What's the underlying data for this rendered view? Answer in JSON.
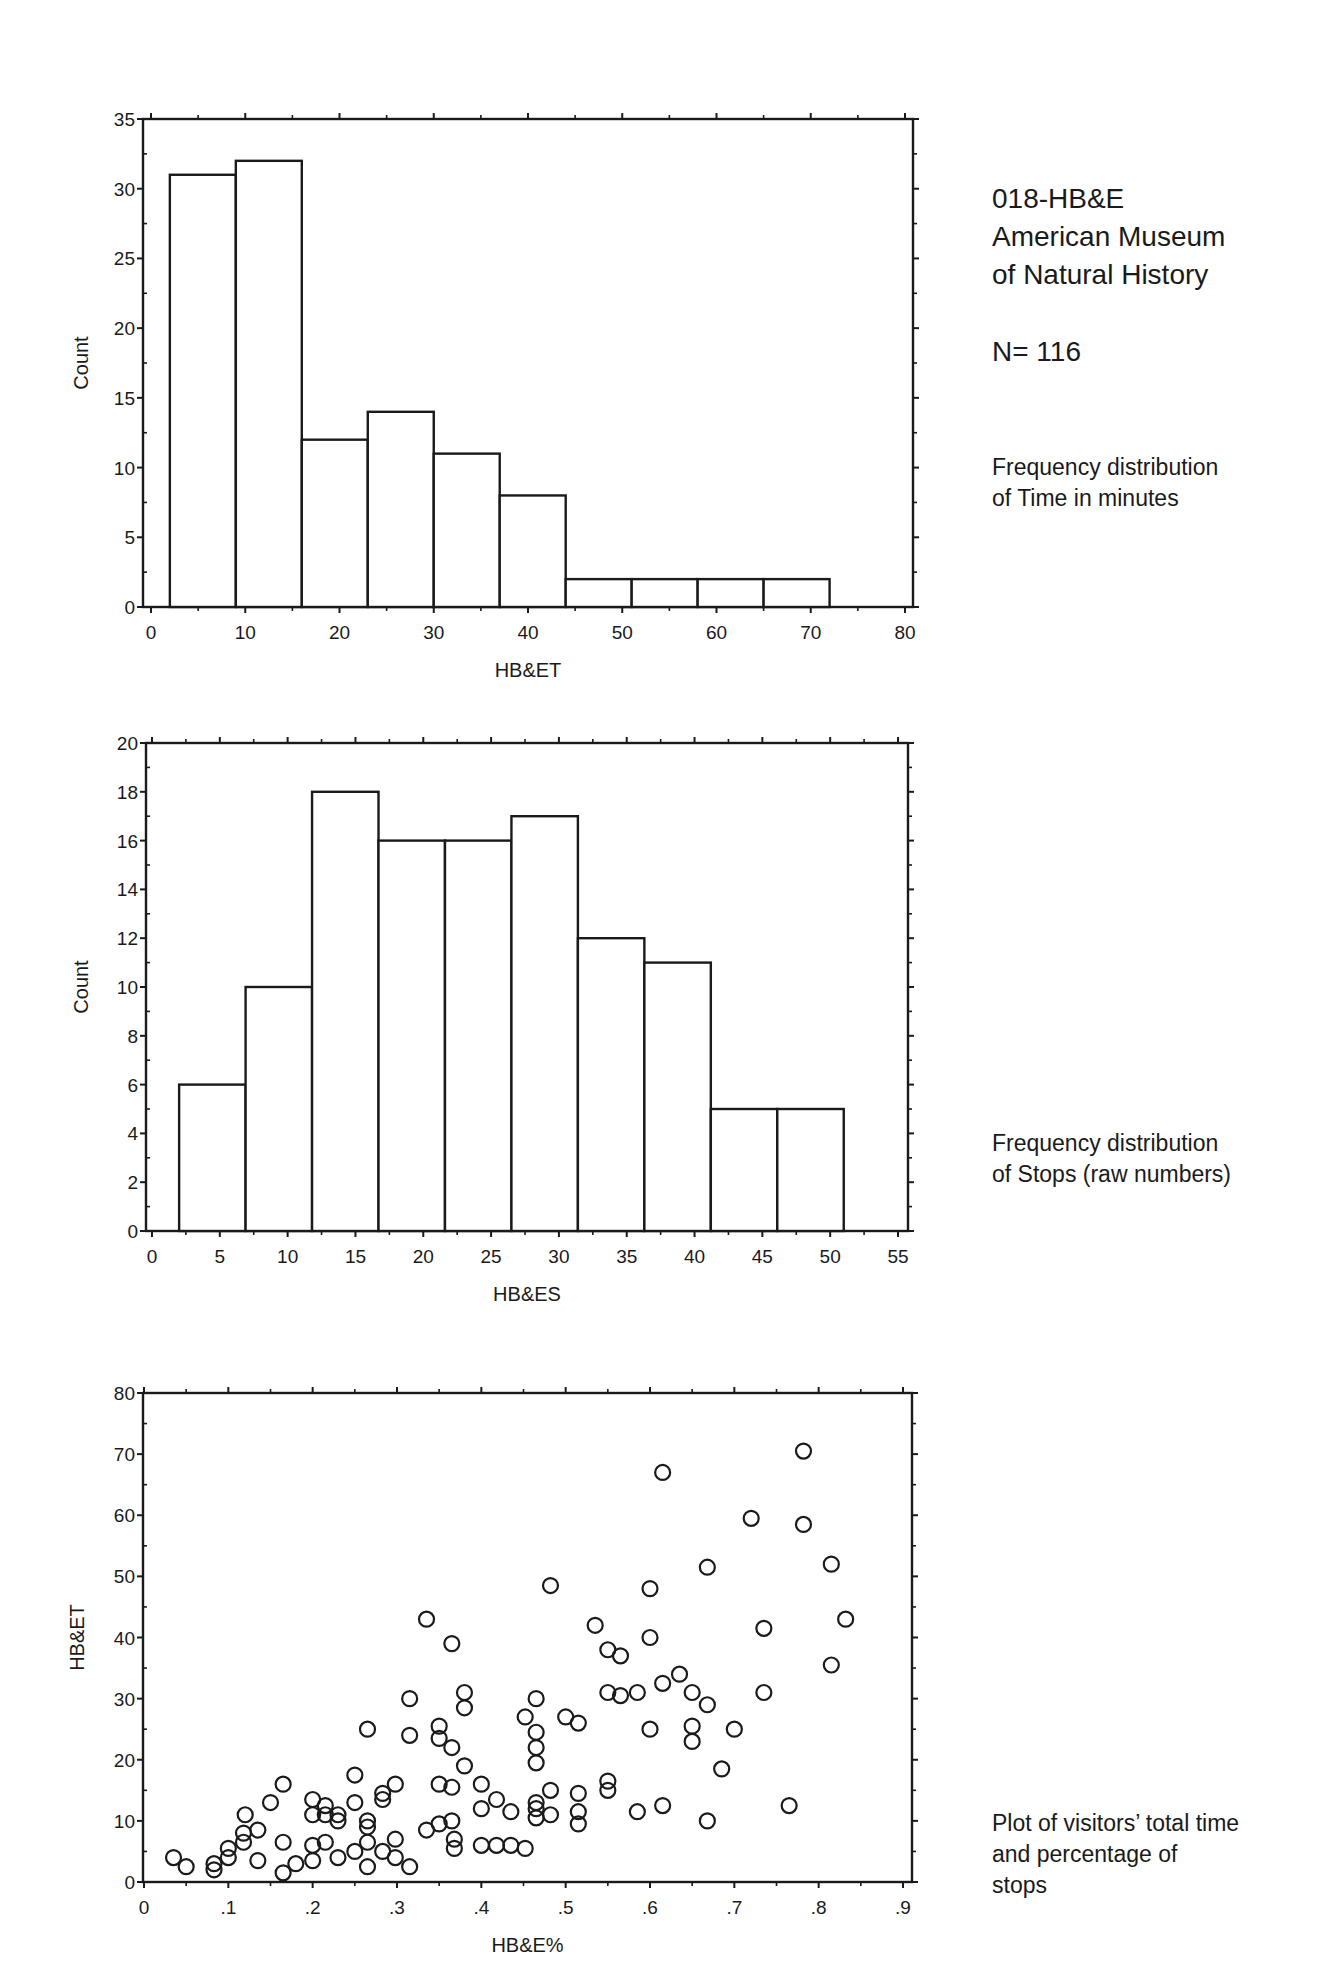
{
  "header": {
    "title_lines": [
      "018-HB&E",
      "American Museum",
      "of Natural History"
    ],
    "n_label": "N= 116"
  },
  "captions": {
    "time_hist": [
      "Frequency distribution",
      "of Time in minutes"
    ],
    "stops_hist": [
      "Frequency distribution",
      "of Stops (raw numbers)"
    ],
    "scatter": [
      "Plot of visitors’ total time",
      "and percentage of",
      "stops"
    ]
  },
  "colors": {
    "ink": "#1a1a1a",
    "background": "#ffffff"
  },
  "chart_data": [
    {
      "type": "bar",
      "title": "Frequency distribution of Time in minutes",
      "xlabel": "HB&ET",
      "ylabel": "Count",
      "xlim": [
        0,
        80
      ],
      "ylim": [
        0,
        35
      ],
      "xticks": [
        0,
        10,
        20,
        30,
        40,
        50,
        60,
        70,
        80
      ],
      "yticks": [
        0,
        5,
        10,
        15,
        20,
        25,
        30,
        35
      ],
      "bin_edges": [
        2,
        9,
        16,
        23,
        30,
        37,
        44,
        51,
        58,
        65,
        72
      ],
      "values": [
        31,
        32,
        12,
        14,
        11,
        8,
        2,
        2,
        2,
        2
      ],
      "grid": false
    },
    {
      "type": "bar",
      "title": "Frequency distribution of Stops (raw numbers)",
      "xlabel": "HB&ES",
      "ylabel": "Count",
      "xlim": [
        0,
        55
      ],
      "ylim": [
        0,
        20
      ],
      "xticks": [
        0,
        5,
        10,
        15,
        20,
        25,
        30,
        35,
        40,
        45,
        50,
        55
      ],
      "yticks": [
        0,
        2,
        4,
        6,
        8,
        10,
        12,
        14,
        16,
        18,
        20
      ],
      "bin_edges": [
        2,
        6.9,
        11.8,
        16.7,
        21.6,
        26.5,
        31.4,
        36.3,
        41.2,
        46.1,
        51
      ],
      "values": [
        6,
        10,
        18,
        16,
        16,
        17,
        12,
        11,
        5,
        5
      ],
      "grid": false
    },
    {
      "type": "scatter",
      "title": "Plot of visitors' total time and percentage of stops",
      "xlabel": "HB&E%",
      "ylabel": "HB&ET",
      "xlim": [
        0,
        0.9
      ],
      "ylim": [
        0,
        80
      ],
      "xticks": [
        0,
        0.1,
        0.2,
        0.3,
        0.4,
        0.5,
        0.6,
        0.7,
        0.8,
        0.9
      ],
      "xtick_labels": [
        "0",
        ".1",
        ".2",
        ".3",
        ".4",
        ".5",
        ".6",
        ".7",
        ".8",
        ".9"
      ],
      "yticks": [
        0,
        10,
        20,
        30,
        40,
        50,
        60,
        70,
        80
      ],
      "marker": "open-circle",
      "points": [
        [
          0.035,
          4
        ],
        [
          0.05,
          2.5
        ],
        [
          0.083,
          3
        ],
        [
          0.083,
          2
        ],
        [
          0.1,
          4
        ],
        [
          0.1,
          5.5
        ],
        [
          0.118,
          8
        ],
        [
          0.118,
          6.5
        ],
        [
          0.12,
          11
        ],
        [
          0.135,
          8.5
        ],
        [
          0.135,
          3.5
        ],
        [
          0.15,
          13
        ],
        [
          0.165,
          16
        ],
        [
          0.165,
          6.5
        ],
        [
          0.165,
          1.5
        ],
        [
          0.18,
          3
        ],
        [
          0.2,
          3.5
        ],
        [
          0.2,
          6
        ],
        [
          0.2,
          11
        ],
        [
          0.2,
          13.5
        ],
        [
          0.215,
          12.5
        ],
        [
          0.215,
          11
        ],
        [
          0.215,
          6.5
        ],
        [
          0.23,
          11
        ],
        [
          0.23,
          10
        ],
        [
          0.23,
          4
        ],
        [
          0.25,
          5
        ],
        [
          0.25,
          13
        ],
        [
          0.25,
          17.5
        ],
        [
          0.265,
          10
        ],
        [
          0.265,
          9
        ],
        [
          0.265,
          6.5
        ],
        [
          0.265,
          2.5
        ],
        [
          0.265,
          25
        ],
        [
          0.283,
          14.5
        ],
        [
          0.283,
          13.5
        ],
        [
          0.283,
          5
        ],
        [
          0.298,
          16
        ],
        [
          0.298,
          7
        ],
        [
          0.298,
          4
        ],
        [
          0.315,
          2.5
        ],
        [
          0.315,
          30
        ],
        [
          0.315,
          24
        ],
        [
          0.335,
          43
        ],
        [
          0.335,
          8.5
        ],
        [
          0.35,
          25.5
        ],
        [
          0.35,
          23.5
        ],
        [
          0.35,
          16
        ],
        [
          0.35,
          9.5
        ],
        [
          0.365,
          39
        ],
        [
          0.365,
          22
        ],
        [
          0.365,
          15.5
        ],
        [
          0.365,
          10
        ],
        [
          0.368,
          7
        ],
        [
          0.368,
          5.5
        ],
        [
          0.38,
          31
        ],
        [
          0.38,
          28.5
        ],
        [
          0.38,
          19
        ],
        [
          0.4,
          16
        ],
        [
          0.4,
          12
        ],
        [
          0.4,
          6
        ],
        [
          0.418,
          13.5
        ],
        [
          0.418,
          6
        ],
        [
          0.435,
          11.5
        ],
        [
          0.435,
          6
        ],
        [
          0.452,
          27
        ],
        [
          0.452,
          5.5
        ],
        [
          0.465,
          30
        ],
        [
          0.465,
          24.5
        ],
        [
          0.465,
          22
        ],
        [
          0.465,
          19.5
        ],
        [
          0.465,
          13
        ],
        [
          0.465,
          12
        ],
        [
          0.465,
          10.5
        ],
        [
          0.482,
          48.5
        ],
        [
          0.482,
          15
        ],
        [
          0.482,
          11
        ],
        [
          0.5,
          27
        ],
        [
          0.515,
          26
        ],
        [
          0.515,
          14.5
        ],
        [
          0.515,
          11.5
        ],
        [
          0.515,
          9.5
        ],
        [
          0.535,
          42
        ],
        [
          0.55,
          38
        ],
        [
          0.55,
          31
        ],
        [
          0.55,
          16.5
        ],
        [
          0.55,
          15
        ],
        [
          0.565,
          37
        ],
        [
          0.565,
          30.5
        ],
        [
          0.585,
          31
        ],
        [
          0.585,
          11.5
        ],
        [
          0.6,
          48
        ],
        [
          0.6,
          40
        ],
        [
          0.6,
          25
        ],
        [
          0.615,
          67
        ],
        [
          0.615,
          32.5
        ],
        [
          0.615,
          12.5
        ],
        [
          0.635,
          34
        ],
        [
          0.65,
          31
        ],
        [
          0.65,
          25.5
        ],
        [
          0.65,
          23
        ],
        [
          0.668,
          51.5
        ],
        [
          0.668,
          29
        ],
        [
          0.668,
          10
        ],
        [
          0.685,
          18.5
        ],
        [
          0.7,
          25
        ],
        [
          0.72,
          59.5
        ],
        [
          0.735,
          41.5
        ],
        [
          0.735,
          31
        ],
        [
          0.765,
          12.5
        ],
        [
          0.782,
          70.5
        ],
        [
          0.782,
          58.5
        ],
        [
          0.815,
          52
        ],
        [
          0.815,
          35.5
        ],
        [
          0.832,
          43
        ]
      ],
      "grid": false
    }
  ]
}
